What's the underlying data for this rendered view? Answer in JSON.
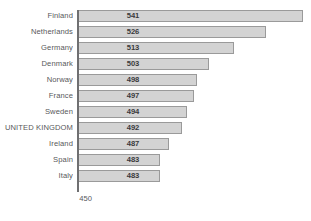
{
  "chart_data": {
    "type": "bar",
    "orientation": "horizontal",
    "title": "",
    "xlabel": "",
    "ylabel": "",
    "xlim": [
      450,
      544
    ],
    "axis_origin_label": "450",
    "grid": false,
    "legend": null,
    "categories": [
      "Finland",
      "Netherlands",
      "Germany",
      "Denmark",
      "Norway",
      "France",
      "Sweden",
      "UNITED KINGDOM",
      "Ireland",
      "Spain",
      "Italy"
    ],
    "values": [
      541,
      526,
      513,
      503,
      498,
      497,
      494,
      492,
      487,
      483,
      483
    ],
    "value_labels": [
      "541",
      "526",
      "513",
      "503",
      "498",
      "497",
      "494",
      "492",
      "487",
      "483",
      "483"
    ],
    "colors": {
      "bar_fill": "#d3d3d3",
      "bar_border": "#9a9a9a",
      "category_text": "#58585a",
      "value_text": "#3a3a3c",
      "axis": "#6f6f71",
      "background": "#ffffff"
    }
  }
}
